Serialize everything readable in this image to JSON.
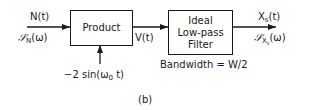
{
  "diagram": {
    "caption": "(b)",
    "blocks": [
      {
        "id": "product",
        "label": "Product"
      },
      {
        "id": "filter",
        "label_lines": [
          "Ideal",
          "Low-pass",
          "Filter"
        ],
        "annotation": "Bandwidth = W/2"
      }
    ],
    "signals": {
      "input": {
        "time": "N(t)",
        "spectrum_symbol": "𝒮",
        "spectrum_sub": "N",
        "spectrum_arg": "(ω)"
      },
      "carrier": {
        "prefix": "−2 sin(ω",
        "sub": "0",
        "suffix": " t)"
      },
      "intermediate": {
        "time": "V(t)"
      },
      "output": {
        "time_main": "X",
        "time_sub": "s",
        "time_arg": "(t)",
        "spectrum_symbol": "𝒮",
        "spectrum_sub": "X",
        "spectrum_subsub": "s",
        "spectrum_arg": "(ω)"
      }
    },
    "edges": [
      {
        "from": "input",
        "to": "product"
      },
      {
        "from": "carrier",
        "to": "product"
      },
      {
        "from": "product",
        "to": "filter",
        "label": "V(t)"
      },
      {
        "from": "filter",
        "to": "output"
      }
    ]
  }
}
